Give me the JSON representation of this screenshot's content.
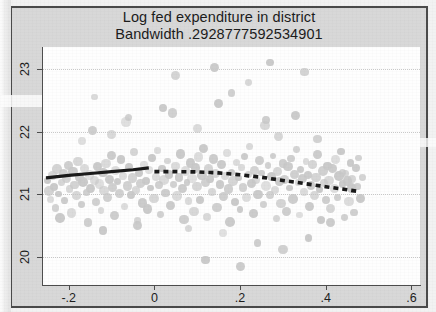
{
  "chart_data": {
    "type": "scatter",
    "title": "Log fed expenditure in district",
    "subtitle": "Bandwidth .2928777592534901",
    "xlabel": "",
    "ylabel": "",
    "xlim": [
      -0.26,
      0.62
    ],
    "ylim": [
      19.55,
      23.35
    ],
    "grid": true,
    "grid_axis": "y",
    "legend": "none",
    "x_ticks": [
      "-.2",
      "0",
      ".2",
      ".4",
      ".6"
    ],
    "x_tick_values": [
      -0.2,
      0,
      0.2,
      0.4,
      0.6
    ],
    "y_ticks": [
      "20",
      "21",
      "22",
      "23"
    ],
    "y_tick_values": [
      20,
      21,
      22,
      23
    ],
    "marker_color": "#c8c8c8",
    "line_color": "#1a1a1a",
    "series": [
      {
        "name": "observations",
        "type": "scatter",
        "points": [
          [
            -0.249,
            21.22
          ],
          [
            -0.246,
            21.05
          ],
          [
            -0.243,
            20.92
          ],
          [
            -0.238,
            21.3
          ],
          [
            -0.234,
            21.12
          ],
          [
            -0.231,
            20.78
          ],
          [
            -0.228,
            21.4
          ],
          [
            -0.224,
            21.0
          ],
          [
            -0.22,
            20.62
          ],
          [
            -0.217,
            21.18
          ],
          [
            -0.213,
            21.33
          ],
          [
            -0.209,
            20.9
          ],
          [
            -0.205,
            21.25
          ],
          [
            -0.201,
            21.46
          ],
          [
            -0.198,
            21.08
          ],
          [
            -0.194,
            20.7
          ],
          [
            -0.19,
            21.36
          ],
          [
            -0.186,
            21.15
          ],
          [
            -0.182,
            20.98
          ],
          [
            -0.178,
            21.52
          ],
          [
            -0.175,
            21.27
          ],
          [
            -0.171,
            20.84
          ],
          [
            -0.167,
            21.19
          ],
          [
            -0.163,
            21.41
          ],
          [
            -0.159,
            21.03
          ],
          [
            -0.155,
            20.55
          ],
          [
            -0.151,
            21.31
          ],
          [
            -0.148,
            21.09
          ],
          [
            -0.144,
            22.02
          ],
          [
            -0.14,
            21.22
          ],
          [
            -0.136,
            20.88
          ],
          [
            -0.132,
            21.44
          ],
          [
            -0.128,
            21.16
          ],
          [
            -0.124,
            20.74
          ],
          [
            -0.12,
            21.35
          ],
          [
            -0.117,
            21.06
          ],
          [
            -0.113,
            21.49
          ],
          [
            -0.109,
            20.95
          ],
          [
            -0.105,
            21.24
          ],
          [
            -0.101,
            21.62
          ],
          [
            -0.097,
            21.11
          ],
          [
            -0.093,
            20.66
          ],
          [
            -0.09,
            21.38
          ],
          [
            -0.086,
            21.2
          ],
          [
            -0.082,
            21.01
          ],
          [
            -0.078,
            21.55
          ],
          [
            -0.074,
            21.29
          ],
          [
            -0.07,
            20.8
          ],
          [
            -0.066,
            22.15
          ],
          [
            -0.063,
            21.13
          ],
          [
            -0.059,
            21.43
          ],
          [
            -0.055,
            20.99
          ],
          [
            -0.051,
            21.26
          ],
          [
            -0.047,
            21.67
          ],
          [
            -0.043,
            21.07
          ],
          [
            -0.039,
            20.58
          ],
          [
            -0.036,
            21.34
          ],
          [
            -0.032,
            21.17
          ],
          [
            -0.028,
            20.86
          ],
          [
            -0.024,
            21.47
          ],
          [
            -0.02,
            21.21
          ],
          [
            -0.016,
            20.76
          ],
          [
            -0.012,
            21.39
          ],
          [
            -0.009,
            21.1
          ],
          [
            -0.005,
            21.58
          ],
          [
            -0.001,
            20.93
          ],
          [
            0.003,
            21.28
          ],
          [
            0.007,
            21.7
          ],
          [
            0.011,
            21.14
          ],
          [
            0.015,
            20.68
          ],
          [
            0.018,
            21.41
          ],
          [
            0.022,
            21.23
          ],
          [
            0.026,
            21.02
          ],
          [
            0.03,
            21.53
          ],
          [
            0.034,
            21.32
          ],
          [
            0.038,
            20.82
          ],
          [
            0.042,
            22.3
          ],
          [
            0.045,
            21.16
          ],
          [
            0.049,
            21.45
          ],
          [
            0.053,
            20.97
          ],
          [
            0.057,
            21.27
          ],
          [
            0.061,
            21.64
          ],
          [
            0.065,
            21.09
          ],
          [
            0.069,
            20.6
          ],
          [
            0.072,
            21.37
          ],
          [
            0.076,
            21.19
          ],
          [
            0.08,
            20.89
          ],
          [
            0.084,
            21.5
          ],
          [
            0.088,
            21.25
          ],
          [
            0.092,
            20.72
          ],
          [
            0.096,
            21.42
          ],
          [
            0.099,
            21.12
          ],
          [
            0.103,
            21.59
          ],
          [
            0.107,
            20.91
          ],
          [
            0.111,
            21.3
          ],
          [
            0.115,
            21.73
          ],
          [
            0.119,
            21.18
          ],
          [
            0.123,
            20.64
          ],
          [
            0.126,
            21.4
          ],
          [
            0.13,
            21.24
          ],
          [
            0.134,
            21.04
          ],
          [
            0.138,
            21.56
          ],
          [
            0.142,
            21.33
          ],
          [
            0.146,
            20.79
          ],
          [
            0.15,
            22.45
          ],
          [
            0.153,
            21.15
          ],
          [
            0.157,
            21.48
          ],
          [
            0.161,
            20.96
          ],
          [
            0.165,
            21.29
          ],
          [
            0.169,
            21.66
          ],
          [
            0.173,
            21.08
          ],
          [
            0.177,
            20.56
          ],
          [
            0.18,
            21.35
          ],
          [
            0.184,
            21.21
          ],
          [
            0.188,
            20.87
          ],
          [
            0.192,
            21.51
          ],
          [
            0.196,
            21.26
          ],
          [
            0.2,
            20.75
          ],
          [
            0.204,
            21.43
          ],
          [
            0.207,
            21.11
          ],
          [
            0.211,
            21.6
          ],
          [
            0.215,
            20.94
          ],
          [
            0.219,
            21.31
          ],
          [
            0.223,
            21.76
          ],
          [
            0.227,
            21.17
          ],
          [
            0.231,
            20.69
          ],
          [
            0.234,
            21.38
          ],
          [
            0.238,
            21.22
          ],
          [
            0.242,
            21.0
          ],
          [
            0.246,
            21.54
          ],
          [
            0.25,
            21.34
          ],
          [
            0.254,
            20.83
          ],
          [
            0.258,
            22.1
          ],
          [
            0.261,
            21.13
          ],
          [
            0.265,
            21.46
          ],
          [
            0.269,
            20.99
          ],
          [
            0.273,
            21.28
          ],
          [
            0.277,
            21.61
          ],
          [
            0.281,
            21.06
          ],
          [
            0.285,
            20.61
          ],
          [
            0.288,
            21.36
          ],
          [
            0.292,
            21.2
          ],
          [
            0.296,
            20.85
          ],
          [
            0.3,
            21.49
          ],
          [
            0.304,
            21.23
          ],
          [
            0.308,
            20.73
          ],
          [
            0.312,
            21.44
          ],
          [
            0.315,
            21.1
          ],
          [
            0.319,
            21.57
          ],
          [
            0.323,
            20.92
          ],
          [
            0.327,
            21.32
          ],
          [
            0.331,
            21.71
          ],
          [
            0.335,
            21.19
          ],
          [
            0.339,
            20.67
          ],
          [
            0.342,
            21.39
          ],
          [
            0.346,
            21.25
          ],
          [
            0.35,
            21.03
          ],
          [
            0.354,
            21.52
          ],
          [
            0.358,
            21.3
          ],
          [
            0.362,
            20.81
          ],
          [
            0.366,
            21.14
          ],
          [
            0.369,
            21.47
          ],
          [
            0.373,
            20.98
          ],
          [
            0.377,
            21.27
          ],
          [
            0.381,
            21.63
          ],
          [
            0.385,
            21.07
          ],
          [
            0.389,
            20.59
          ],
          [
            0.393,
            21.37
          ],
          [
            0.396,
            21.18
          ],
          [
            0.4,
            20.9
          ],
          [
            0.404,
            21.45
          ],
          [
            0.408,
            21.22
          ],
          [
            0.412,
            20.77
          ],
          [
            0.416,
            21.41
          ],
          [
            0.42,
            21.09
          ],
          [
            0.423,
            21.55
          ],
          [
            0.427,
            20.95
          ],
          [
            0.431,
            21.29
          ],
          [
            0.435,
            21.68
          ],
          [
            0.439,
            21.16
          ],
          [
            0.443,
            20.63
          ],
          [
            0.447,
            21.33
          ],
          [
            0.45,
            21.21
          ],
          [
            0.454,
            20.88
          ],
          [
            0.458,
            21.5
          ],
          [
            0.462,
            21.24
          ],
          [
            0.466,
            20.71
          ],
          [
            0.47,
            21.42
          ],
          [
            0.474,
            21.12
          ],
          [
            0.477,
            21.58
          ],
          [
            0.481,
            20.93
          ],
          [
            0.485,
            21.26
          ],
          [
            -0.14,
            22.55
          ],
          [
            -0.06,
            22.22
          ],
          [
            0.02,
            22.38
          ],
          [
            0.1,
            22.05
          ],
          [
            0.18,
            22.62
          ],
          [
            0.26,
            22.18
          ],
          [
            0.05,
            22.9
          ],
          [
            0.14,
            23.02
          ],
          [
            -0.1,
            21.95
          ],
          [
            0.33,
            22.26
          ],
          [
            0.38,
            21.88
          ],
          [
            0.22,
            22.78
          ],
          [
            -0.17,
            21.85
          ],
          [
            0.29,
            21.92
          ],
          [
            0.08,
            20.45
          ],
          [
            0.16,
            20.38
          ],
          [
            0.24,
            20.22
          ],
          [
            -0.04,
            20.5
          ],
          [
            0.12,
            19.95
          ],
          [
            0.2,
            19.85
          ],
          [
            0.3,
            20.12
          ],
          [
            -0.12,
            20.42
          ],
          [
            0.36,
            20.3
          ],
          [
            0.44,
            21.35
          ],
          [
            0.46,
            21.1
          ],
          [
            0.41,
            20.55
          ],
          [
            0.35,
            22.95
          ],
          [
            0.27,
            23.1
          ]
        ]
      },
      {
        "name": "local linear fit (left of cutoff)",
        "type": "line",
        "style": "solid",
        "points": [
          [
            -0.253,
            21.26
          ],
          [
            -0.2,
            21.3
          ],
          [
            -0.15,
            21.33
          ],
          [
            -0.1,
            21.36
          ],
          [
            -0.05,
            21.39
          ],
          [
            -0.013,
            21.42
          ]
        ]
      },
      {
        "name": "local linear fit (right of cutoff)",
        "type": "line",
        "style": "dashed",
        "points": [
          [
            0.0,
            21.36
          ],
          [
            0.05,
            21.36
          ],
          [
            0.1,
            21.355
          ],
          [
            0.15,
            21.34
          ],
          [
            0.2,
            21.31
          ],
          [
            0.25,
            21.27
          ],
          [
            0.3,
            21.22
          ],
          [
            0.35,
            21.17
          ],
          [
            0.4,
            21.12
          ],
          [
            0.45,
            21.07
          ],
          [
            0.48,
            21.04
          ]
        ]
      }
    ]
  }
}
